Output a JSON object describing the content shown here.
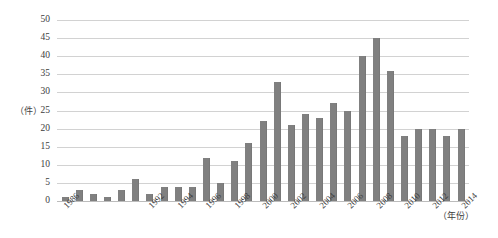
{
  "chart_data": {
    "type": "bar",
    "title": "",
    "subtitle": "",
    "xlabel": "（年份）",
    "ylabel": "（件）",
    "ylim": [
      0,
      50
    ],
    "ytick_step": 5,
    "yticks": [
      50,
      45,
      40,
      35,
      30,
      25,
      20,
      15,
      10,
      5,
      0
    ],
    "grid": "horizontal",
    "legend": "none",
    "bar_color": "#808080",
    "gridline_color": "#d2d2d2",
    "categories": [
      "1986",
      "1987",
      "1988",
      "1989",
      "1990",
      "1991",
      "1992",
      "1993",
      "1994",
      "1995",
      "1996",
      "1997",
      "1998",
      "1999",
      "2000",
      "2001",
      "2002",
      "2003",
      "2004",
      "2005",
      "2006",
      "2007",
      "2008",
      "2009",
      "2010",
      "2011",
      "2012",
      "2013",
      "2014"
    ],
    "values": [
      1,
      3,
      2,
      1,
      3,
      6,
      2,
      4,
      4,
      4,
      12,
      5,
      11,
      16,
      22,
      33,
      21,
      24,
      23,
      27,
      25,
      40,
      45,
      36,
      18,
      20,
      20,
      18,
      20
    ],
    "visible_xtick_labels": [
      "1986",
      "1992",
      "1994",
      "1996",
      "1998",
      "2000",
      "2002",
      "2004",
      "2006",
      "2008",
      "2010",
      "2012",
      "2014"
    ],
    "visible_xtick_indices": [
      0,
      6,
      8,
      10,
      12,
      14,
      16,
      18,
      20,
      22,
      24,
      26,
      28
    ]
  }
}
